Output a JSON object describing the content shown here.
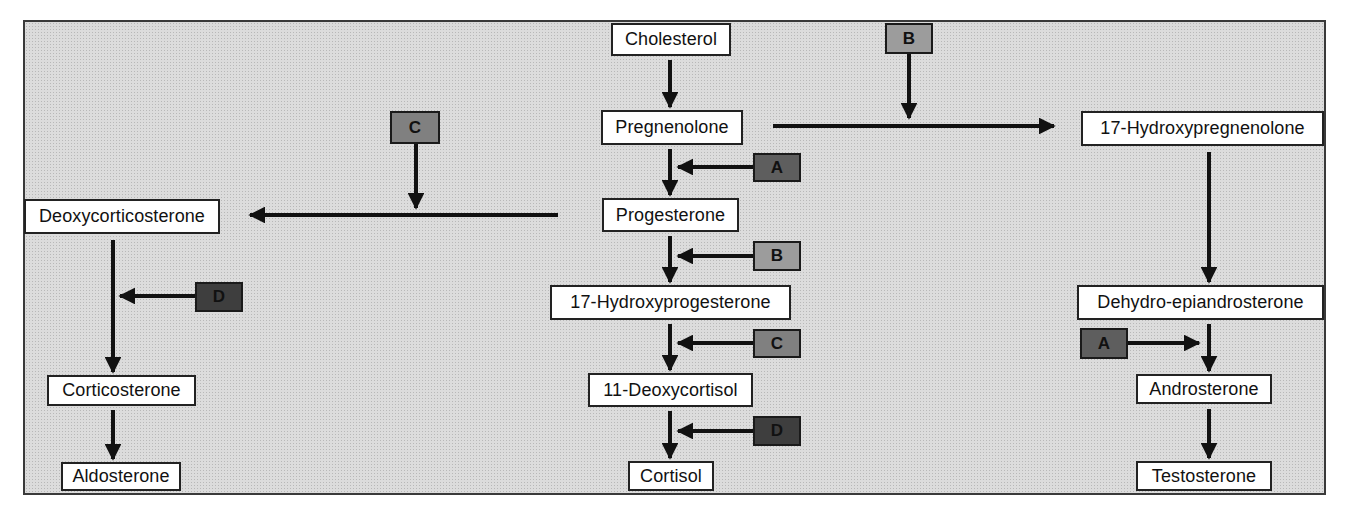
{
  "diagram": {
    "colors": {
      "background": "#dcdcdc",
      "node_fill": "#ffffff",
      "enzyme_A": "#5e5e5e",
      "enzyme_B": "#9c9c9c",
      "enzyme_C": "#808080",
      "enzyme_D": "#3e3e3e",
      "arrow": "#111111"
    },
    "nodes": {
      "cholesterol": "Cholesterol",
      "pregnenolone": "Pregnenolone",
      "progesterone": "Progesterone",
      "hydroxyprogesterone_17": "17-Hydroxyprogesterone",
      "deoxycortisol_11": "11-Deoxycortisol",
      "cortisol": "Cortisol",
      "deoxycorticosterone": "Deoxycorticosterone",
      "corticosterone": "Corticosterone",
      "aldosterone": "Aldosterone",
      "hydroxypregnenolone_17": "17-Hydroxypregnenolone",
      "dhea": "Dehydro-epiandrosterone",
      "androsterone": "Androsterone",
      "testosterone": "Testosterone"
    },
    "enzymes": {
      "b_top": "B",
      "c_top": "C",
      "a_center": "A",
      "b_center": "B",
      "c_center": "C",
      "d_center": "D",
      "d_left": "D",
      "a_right": "A"
    },
    "edges": [
      {
        "from": "Cholesterol",
        "to": "Pregnenolone",
        "enzyme": null
      },
      {
        "from": "Pregnenolone",
        "to": "Progesterone",
        "enzyme": "A"
      },
      {
        "from": "Pregnenolone",
        "to": "17-Hydroxypregnenolone",
        "enzyme": "B"
      },
      {
        "from": "Progesterone",
        "to": "17-Hydroxyprogesterone",
        "enzyme": "B"
      },
      {
        "from": "Progesterone",
        "to": "Deoxycorticosterone",
        "enzyme": "C"
      },
      {
        "from": "17-Hydroxyprogesterone",
        "to": "11-Deoxycortisol",
        "enzyme": "C"
      },
      {
        "from": "11-Deoxycortisol",
        "to": "Cortisol",
        "enzyme": "D"
      },
      {
        "from": "Deoxycorticosterone",
        "to": "Corticosterone",
        "enzyme": "D"
      },
      {
        "from": "Corticosterone",
        "to": "Aldosterone",
        "enzyme": null
      },
      {
        "from": "17-Hydroxypregnenolone",
        "to": "Dehydro-epiandrosterone",
        "enzyme": null
      },
      {
        "from": "Dehydro-epiandrosterone",
        "to": "Androsterone",
        "enzyme": "A"
      },
      {
        "from": "Androsterone",
        "to": "Testosterone",
        "enzyme": null
      }
    ]
  }
}
